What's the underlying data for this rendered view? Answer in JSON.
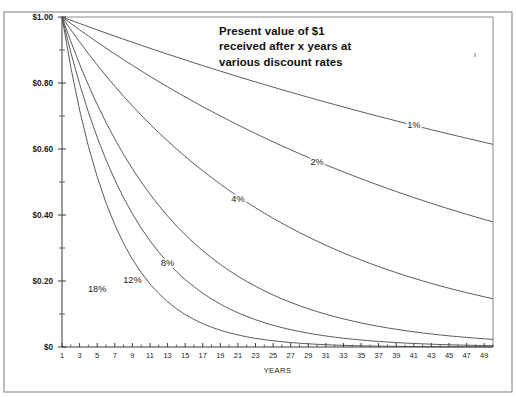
{
  "chart_data": {
    "type": "line",
    "title": "Present value of $1 received after x years at various discount rates",
    "title_lines": [
      "Present value of $1",
      "received after x years at",
      "various discount rates"
    ],
    "xlabel": "YEARS",
    "ylabel": "",
    "xlim": [
      1,
      50
    ],
    "ylim": [
      0,
      1
    ],
    "grid": false,
    "legend_position": "inline-curve-labels",
    "x_tick_labels": [
      "1",
      "3",
      "5",
      "7",
      "9",
      "11",
      "13",
      "15",
      "17",
      "19",
      "21",
      "23",
      "25",
      "27",
      "29",
      "31",
      "33",
      "35",
      "37",
      "39",
      "41",
      "43",
      "45",
      "47",
      "49"
    ],
    "x_tick_values": [
      1,
      3,
      5,
      7,
      9,
      11,
      13,
      15,
      17,
      19,
      21,
      23,
      25,
      27,
      29,
      31,
      33,
      35,
      37,
      39,
      41,
      43,
      45,
      47,
      49
    ],
    "x_minor_step": 1,
    "y_tick_labels": [
      "$0",
      "$0.20",
      "$0.40",
      "$0.60",
      "$0.80",
      "$1.00"
    ],
    "y_tick_values": [
      0,
      0.2,
      0.4,
      0.6,
      0.8,
      1.0
    ],
    "y_minor_values": [
      0.1,
      0.3,
      0.5,
      0.7,
      0.9
    ],
    "series": [
      {
        "name": "1%",
        "rate": 0.01,
        "label": "1%",
        "label_x_year": 41,
        "label_y_value": 0.665,
        "values": [
          1.0,
          0.9901,
          0.9803,
          0.9706,
          0.961,
          0.9515,
          0.942,
          0.9327,
          0.9235,
          0.9143,
          0.9053,
          0.8963,
          0.8874,
          0.8787,
          0.87,
          0.8613,
          0.8528,
          0.8444,
          0.836,
          0.8277,
          0.8195,
          0.8114,
          0.8034,
          0.7954,
          0.7876,
          0.7798,
          0.772,
          0.7644,
          0.7568,
          0.7493,
          0.7419,
          0.7346,
          0.7273,
          0.7201,
          0.713,
          0.7059,
          0.6989,
          0.692,
          0.6852,
          0.6784,
          0.6717,
          0.665,
          0.6584,
          0.6519,
          0.6454,
          0.6391,
          0.6327,
          0.6265,
          0.6203,
          0.6141
        ]
      },
      {
        "name": "2%",
        "rate": 0.02,
        "label": "2%",
        "label_x_year": 30,
        "label_y_value": 0.552,
        "values": [
          1.0,
          0.9804,
          0.9612,
          0.9423,
          0.9238,
          0.9057,
          0.888,
          0.8706,
          0.8535,
          0.8368,
          0.8203,
          0.8043,
          0.7885,
          0.773,
          0.7579,
          0.743,
          0.7284,
          0.7142,
          0.7002,
          0.6864,
          0.673,
          0.6598,
          0.6468,
          0.6342,
          0.6217,
          0.6095,
          0.5976,
          0.5859,
          0.5744,
          0.5631,
          0.5521,
          0.5412,
          0.5306,
          0.5202,
          0.51,
          0.5,
          0.4902,
          0.4806,
          0.4712,
          0.4619,
          0.4529,
          0.444,
          0.4353,
          0.4268,
          0.4184,
          0.4102,
          0.4022,
          0.3943,
          0.3865,
          0.379
        ]
      },
      {
        "name": "4%",
        "rate": 0.04,
        "label": "4%",
        "label_x_year": 21,
        "label_y_value": 0.439,
        "values": [
          1.0,
          0.9615,
          0.9246,
          0.889,
          0.8548,
          0.8219,
          0.7903,
          0.7599,
          0.7307,
          0.7026,
          0.6756,
          0.6496,
          0.6246,
          0.6006,
          0.5775,
          0.5553,
          0.5339,
          0.5134,
          0.4936,
          0.4746,
          0.4564,
          0.4388,
          0.422,
          0.4057,
          0.3901,
          0.3751,
          0.3607,
          0.3468,
          0.3335,
          0.3207,
          0.3083,
          0.2965,
          0.2851,
          0.2741,
          0.2636,
          0.2534,
          0.2437,
          0.2343,
          0.2253,
          0.2166,
          0.2083,
          0.2003,
          0.1926,
          0.1852,
          0.1781,
          0.1712,
          0.1646,
          0.1583,
          0.1522,
          0.1464
        ]
      },
      {
        "name": "8%",
        "rate": 0.08,
        "label": "8%",
        "label_x_year": 13,
        "label_y_value": 0.245,
        "values": [
          1.0,
          0.9259,
          0.8573,
          0.7938,
          0.735,
          0.6806,
          0.6302,
          0.5835,
          0.5403,
          0.5002,
          0.4632,
          0.4289,
          0.3971,
          0.3677,
          0.3405,
          0.3152,
          0.2919,
          0.2703,
          0.2502,
          0.2317,
          0.2145,
          0.1987,
          0.1839,
          0.1703,
          0.1577,
          0.146,
          0.1352,
          0.1252,
          0.1159,
          0.1073,
          0.0994,
          0.092,
          0.0852,
          0.0789,
          0.073,
          0.0676,
          0.0626,
          0.058,
          0.0537,
          0.0497,
          0.046,
          0.0426,
          0.0395,
          0.0365,
          0.0338,
          0.0313,
          0.029,
          0.0269,
          0.0249,
          0.023
        ]
      },
      {
        "name": "12%",
        "rate": 0.12,
        "label": "12%",
        "label_x_year": 9,
        "label_y_value": 0.195,
        "values": [
          1.0,
          0.8929,
          0.7972,
          0.7118,
          0.6355,
          0.5674,
          0.5066,
          0.4523,
          0.4039,
          0.3606,
          0.322,
          0.2875,
          0.2567,
          0.2292,
          0.2046,
          0.1827,
          0.1631,
          0.1456,
          0.13,
          0.1161,
          0.1037,
          0.0926,
          0.0826,
          0.0738,
          0.0659,
          0.0588,
          0.0525,
          0.0469,
          0.0419,
          0.0374,
          0.0334,
          0.0298,
          0.0266,
          0.0238,
          0.0212,
          0.0189,
          0.0169,
          0.0151,
          0.0135,
          0.012,
          0.0107,
          0.0096,
          0.0086,
          0.0076,
          0.0068,
          0.0061,
          0.0054,
          0.0049,
          0.0043,
          0.0039
        ]
      },
      {
        "name": "18%",
        "rate": 0.18,
        "label": "18%",
        "label_x_year": 5,
        "label_y_value": 0.166,
        "values": [
          1.0,
          0.8475,
          0.7182,
          0.6086,
          0.5158,
          0.4371,
          0.3704,
          0.3139,
          0.266,
          0.2255,
          0.1911,
          0.1619,
          0.1372,
          0.1163,
          0.0985,
          0.0835,
          0.0708,
          0.06,
          0.0508,
          0.0431,
          0.0365,
          0.0309,
          0.0262,
          0.0222,
          0.0188,
          0.016,
          0.0135,
          0.0115,
          0.0097,
          0.0082,
          0.007,
          0.0059,
          0.005,
          0.0042,
          0.0036,
          0.003,
          0.0026,
          0.0022,
          0.0019,
          0.0016,
          0.0013,
          0.0011,
          0.001,
          0.0008,
          0.0007,
          0.0006,
          0.0005,
          0.0004,
          0.0004,
          0.0003
        ]
      }
    ]
  },
  "colors": {
    "curve": "#4a4a4a",
    "axis": "#3a3a3a",
    "frame": "#7d7d7d",
    "text": "#1b1b1b",
    "background": "#ffffff"
  }
}
